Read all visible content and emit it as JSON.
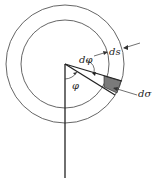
{
  "diagram": {
    "labels": {
      "dphi": "dφ",
      "ds": "ds",
      "phi": "φ",
      "dsigma": "dσ"
    },
    "colors": {
      "stroke": "#444444",
      "shade": "#7a7a7a",
      "background": "#ffffff"
    }
  }
}
